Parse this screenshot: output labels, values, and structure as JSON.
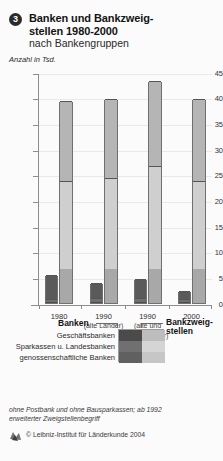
{
  "header": {
    "number": "3",
    "title_line1": "Banken und Bankzweig-",
    "title_line2": "stellen 1980-2000",
    "subtitle": "nach Bankengruppen",
    "units": "Anzahl in Tsd."
  },
  "chart_data": {
    "type": "bar",
    "subtitle": "nach Bankengruppen",
    "ylabel": "Anzahl in Tsd.",
    "xlabel": "",
    "ylim": [
      0,
      45
    ],
    "yticks": [
      0,
      5,
      10,
      15,
      20,
      25,
      30,
      35,
      40,
      45
    ],
    "ytick_labels": [
      "0",
      "5",
      "10",
      "15",
      "20",
      "25",
      "30",
      "35",
      "40",
      "45"
    ],
    "grid": true,
    "legend_position": "below",
    "categories": [
      "1980",
      "1990",
      "1990",
      "2000"
    ],
    "category_notes": [
      "",
      "(alte Länder)",
      "(alte und neue Länder)",
      ""
    ],
    "groups": [
      {
        "name": "Banken",
        "stack_order": [
          "Geschäftsbanken",
          "Sparkassen u. Landesbanken",
          "genossenschaftliche Banken"
        ],
        "series": [
          {
            "name": "Geschäftsbanken",
            "color": "#4c4c4c",
            "values": [
              0.25,
              0.34,
              0.34,
              0.3
            ]
          },
          {
            "name": "Sparkassen u. Landesbanken",
            "color": "#6e6e6e",
            "values": [
              0.6,
              0.8,
              0.8,
              0.6
            ]
          },
          {
            "name": "genossenschaftliche Banken",
            "color": "#5a5a5a",
            "values": [
              4.65,
              2.86,
              3.56,
              1.6
            ]
          }
        ],
        "totals": [
          5.5,
          4.0,
          4.7,
          2.5
        ]
      },
      {
        "name": "Bankzweigstellen",
        "stack_order": [
          "Geschäftsbanken",
          "Sparkassen u. Landesbanken",
          "genossenschaftliche Banken"
        ],
        "series": [
          {
            "name": "Geschäftsbanken",
            "color": "#a8a8a8",
            "values": [
              6.7,
              6.8,
              6.8,
              6.8
            ]
          },
          {
            "name": "Sparkassen u. Landesbanken",
            "color": "#cfcfcf",
            "values": [
              17.1,
              17.6,
              19.9,
              17.1
            ]
          },
          {
            "name": "genossenschaftliche Banken",
            "color": "#b5b5b5",
            "values": [
              15.6,
              15.4,
              16.7,
              15.9
            ]
          }
        ],
        "totals": [
          39.4,
          39.8,
          43.4,
          39.8
        ],
        "boundaries": [
          [
            0,
            6.7,
            15.6,
            32.8,
            39.4
          ],
          [
            0,
            6.8,
            15.9,
            33.4,
            39.8
          ],
          [
            0,
            6.8,
            17.4,
            36.7,
            43.4
          ],
          [
            0,
            6.8,
            15.5,
            32.9,
            39.8
          ]
        ]
      }
    ]
  },
  "legend": {
    "head_left": "Banken",
    "head_right_line1": "Bankzweig-",
    "head_right_line2": "stellen",
    "rows": [
      {
        "label": "Geschäftsbanken",
        "dark": "#4a4a4a",
        "light": "#bdbdbd"
      },
      {
        "label": "Sparkassen u. Landesbanken",
        "dark": "#707070",
        "light": "#d5d5d5"
      },
      {
        "label": "genossenschaftliche Banken",
        "dark": "#606060",
        "light": "#c6c6c6"
      }
    ]
  },
  "footer": {
    "footnote_line1": "ohne Postbank und ohne Bausparkassen; ab 1992",
    "footnote_line2": "erweiterter Zweigstellenbegriff",
    "copyright": "© Leibniz-Institut für Länderkunde 2004"
  },
  "colors": {
    "axis": "#8d8d8d",
    "grid": "#e9e9e9",
    "background": "#fbfbfb",
    "text": "#1a1a1a"
  }
}
